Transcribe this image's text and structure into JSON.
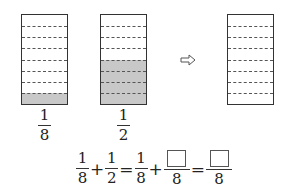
{
  "diagram": {
    "rows_per_box": 8,
    "boxes": [
      {
        "id": "left",
        "shaded_rows": 1,
        "label": {
          "numerator": "1",
          "denominator": "8"
        }
      },
      {
        "id": "middle",
        "shaded_rows": 4,
        "label": {
          "numerator": "1",
          "denominator": "2"
        }
      },
      {
        "id": "right",
        "shaded_rows": 0
      }
    ],
    "arrow": "right-hollow-arrow",
    "colors": {
      "shade": "#c8c8c8",
      "border": "#333333",
      "dash": "#555555"
    }
  },
  "equation": {
    "terms": [
      {
        "numerator": "1",
        "denominator": "8"
      },
      {
        "op": "+"
      },
      {
        "numerator": "1",
        "denominator": "2"
      },
      {
        "op": "="
      },
      {
        "numerator": "1",
        "denominator": "8"
      },
      {
        "op": "+"
      },
      {
        "numerator": "",
        "numerator_blank": true,
        "denominator": "8"
      },
      {
        "op": "="
      },
      {
        "numerator": "",
        "numerator_blank": true,
        "denominator": "8"
      }
    ],
    "ops": {
      "plus": "+",
      "equals": "="
    }
  }
}
